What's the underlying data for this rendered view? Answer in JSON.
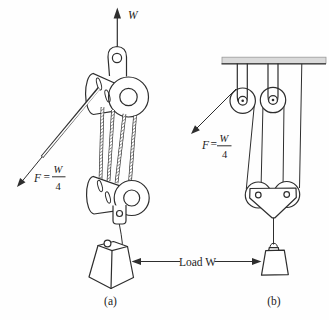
{
  "figure": {
    "type": "pulley-systems-diagram",
    "load_label": "Load W",
    "panel_a": {
      "caption": "(a)",
      "weight_arrow_label": "W",
      "force": {
        "symbol": "F",
        "equals": "=",
        "numerator": "W",
        "denominator": "4"
      }
    },
    "panel_b": {
      "caption": "(b)",
      "force": {
        "symbol": "F",
        "equals": "=",
        "numerator": "W",
        "denominator": "4"
      }
    },
    "colors": {
      "line": "#2e2e2e",
      "ceiling_fill": "#dadada",
      "background": "#fefefe"
    }
  }
}
